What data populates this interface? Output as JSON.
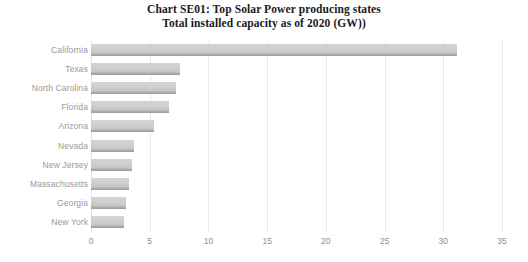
{
  "chart_data": {
    "type": "bar",
    "orientation": "horizontal",
    "title": "Chart SE01: Top Solar Power producing states",
    "subtitle": "Total installed capacity as of 2020 (GW))",
    "title_lines": [
      "Chart SE01: Top Solar Power producing states",
      "Total installed capacity as of 2020 (GW))"
    ],
    "categories": [
      "California",
      "Texas",
      "North Carolina",
      "Florida",
      "Arizona",
      "Nevada",
      "New Jersey",
      "Massachusetts",
      "Georgia",
      "New York"
    ],
    "values": [
      31.2,
      7.6,
      7.2,
      6.6,
      5.4,
      3.7,
      3.5,
      3.2,
      2.95,
      2.8
    ],
    "series": [
      {
        "name": "Total installed capacity (GW)",
        "values": [
          31.2,
          7.6,
          7.2,
          6.6,
          5.4,
          3.7,
          3.5,
          3.2,
          2.95,
          2.8
        ]
      }
    ],
    "xlabel": "",
    "ylabel": "",
    "xlim": [
      0,
      35
    ],
    "xticks": [
      0,
      5,
      10,
      15,
      20,
      25,
      30,
      35
    ],
    "xtick_labels": [
      "0",
      "5",
      "10",
      "15",
      "20",
      "25",
      "30",
      "35"
    ],
    "grid": "vertical",
    "legend": "none",
    "colors": {
      "bar_fill": "#cfcfcf",
      "bar_edge": "#a0a0a0",
      "gridline": "#e9e9e9",
      "tick_label": "#8f8f8f",
      "category_label": "#9a9a9a",
      "title": "#1a1a1a",
      "background": "#ffffff"
    }
  }
}
